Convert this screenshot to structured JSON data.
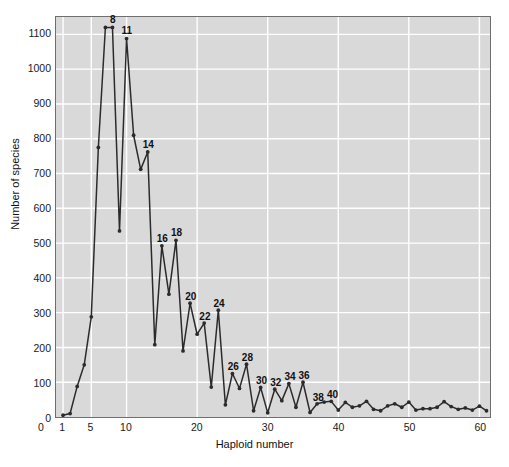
{
  "chart_data": {
    "type": "line",
    "title": "",
    "xlabel": "Haploid number",
    "ylabel": "Number of species",
    "xlim": [
      0,
      61.5
    ],
    "ylim": [
      0,
      1150
    ],
    "grid": true,
    "legend": null,
    "marker": "filled-circle",
    "line_color": "#2b2b2b",
    "panel_color": "#d9d9d9",
    "grid_color": "#ffffff",
    "xticks": [
      0,
      1,
      5,
      10,
      20,
      30,
      40,
      50,
      60
    ],
    "xtick_labels": [
      "0",
      "1",
      "5",
      "10",
      "20",
      "30",
      "40",
      "50",
      "60"
    ],
    "yticks": [
      0,
      100,
      200,
      300,
      400,
      500,
      600,
      700,
      800,
      900,
      1000,
      1100
    ],
    "ytick_labels": [
      "0",
      "100",
      "200",
      "300",
      "400",
      "500",
      "600",
      "700",
      "800",
      "900",
      "1000",
      "1100"
    ],
    "x": [
      1,
      2,
      3,
      4,
      5,
      6,
      7,
      8,
      9,
      10,
      11,
      12,
      13,
      14,
      15,
      16,
      17,
      18,
      19,
      20,
      21,
      22,
      23,
      24,
      25,
      26,
      27,
      28,
      29,
      30,
      31,
      32,
      33,
      34,
      35,
      36,
      37,
      38,
      39,
      40,
      41,
      42,
      43,
      44,
      45,
      46,
      47,
      48,
      49,
      50,
      51,
      52,
      53,
      54,
      55,
      56,
      57,
      58,
      59,
      60,
      61
    ],
    "values": [
      5,
      10,
      88,
      150,
      288,
      775,
      1120,
      1120,
      535,
      1088,
      810,
      712,
      762,
      208,
      492,
      353,
      508,
      190,
      327,
      238,
      270,
      86,
      307,
      35,
      125,
      82,
      152,
      18,
      85,
      12,
      80,
      47,
      96,
      28,
      100,
      13,
      38,
      43,
      45,
      20,
      42,
      28,
      32,
      45,
      22,
      18,
      32,
      38,
      28,
      43,
      20,
      24,
      24,
      28,
      44,
      30,
      22,
      26,
      20,
      31,
      18
    ],
    "point_labels": [
      {
        "x": 8,
        "y": 1120,
        "text": "8"
      },
      {
        "x": 10,
        "y": 1088,
        "text": "11"
      },
      {
        "x": 13,
        "y": 762,
        "text": "14"
      },
      {
        "x": 15,
        "y": 492,
        "text": "16"
      },
      {
        "x": 17,
        "y": 508,
        "text": "18"
      },
      {
        "x": 19,
        "y": 327,
        "text": "20"
      },
      {
        "x": 21,
        "y": 270,
        "text": "22"
      },
      {
        "x": 23,
        "y": 307,
        "text": "24"
      },
      {
        "x": 25,
        "y": 125,
        "text": "26"
      },
      {
        "x": 27,
        "y": 152,
        "text": "28"
      },
      {
        "x": 29,
        "y": 85,
        "text": "30"
      },
      {
        "x": 31,
        "y": 80,
        "text": "32"
      },
      {
        "x": 33,
        "y": 96,
        "text": "34"
      },
      {
        "x": 35,
        "y": 100,
        "text": "36"
      },
      {
        "x": 37,
        "y": 38,
        "text": "38"
      },
      {
        "x": 39,
        "y": 45,
        "text": "40"
      }
    ]
  }
}
